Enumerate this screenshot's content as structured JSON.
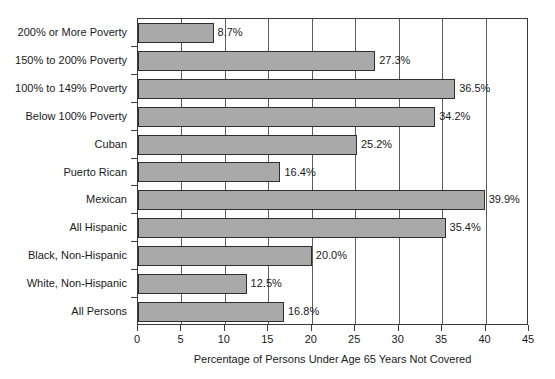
{
  "chart_data": {
    "type": "bar",
    "orientation": "horizontal",
    "title": "",
    "xlabel": "Percentage of Persons Under Age 65 Years Not Covered",
    "ylabel": "",
    "xlim": [
      0,
      45
    ],
    "xticks": [
      0,
      5,
      10,
      15,
      20,
      25,
      30,
      35,
      40,
      45
    ],
    "xtick_labels": [
      "0",
      "5",
      "10",
      "15",
      "20",
      "25",
      "30",
      "35",
      "40",
      "45"
    ],
    "grid": "vertical",
    "legend": "none",
    "bar_color": "#a9a9a9",
    "bar_edge_color": "#2e2e2e",
    "categories": [
      "200% or More Poverty",
      "150% to 200% Poverty",
      "100% to 149% Poverty",
      "Below 100% Poverty",
      "Cuban",
      "Puerto Rican",
      "Mexican",
      "All Hispanic",
      "Black, Non-Hispanic",
      "White, Non-Hispanic",
      "All Persons"
    ],
    "values": [
      8.7,
      27.3,
      36.5,
      34.2,
      25.2,
      16.4,
      39.9,
      35.4,
      20.0,
      12.5,
      16.8
    ],
    "data_labels": [
      "8.7%",
      "27.3%",
      "36.5%",
      "34.2%",
      "25.2%",
      "16.4%",
      "39.9%",
      "35.4%",
      "20.0%",
      "12.5%",
      "16.8%"
    ]
  }
}
